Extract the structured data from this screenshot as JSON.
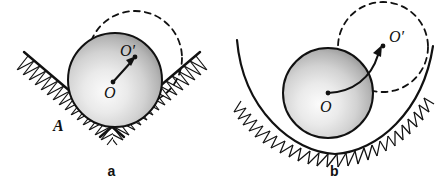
{
  "figure": {
    "background_color": "#ffffff",
    "line_color": "#111111",
    "sphere_fill_light": "#f2f2f2",
    "sphere_fill_dark": "#8f8f8f",
    "panels": [
      {
        "id": "a",
        "caption": "a",
        "support_type": "v-groove",
        "labels": {
          "center_initial": "O",
          "center_final": "O′",
          "contact_point": "A"
        },
        "sphere": {
          "cx": 115,
          "cy": 80,
          "r": 47
        },
        "ghost_circle": {
          "cx": 135,
          "cy": 58,
          "r": 47,
          "style": "dashed"
        },
        "displacement_arrow": {
          "from_label": "O",
          "to_label": "O′",
          "from": [
            113,
            82
          ],
          "to": [
            135,
            58
          ],
          "style": "straight"
        }
      },
      {
        "id": "b",
        "caption": "b",
        "support_type": "concave-trough",
        "labels": {
          "center_initial": "O",
          "center_final": "O′"
        },
        "sphere": {
          "cx": 105,
          "cy": 93,
          "r": 45
        },
        "ghost_circle": {
          "cx": 160,
          "cy": 47,
          "r": 45,
          "style": "dashed"
        },
        "displacement_arrow": {
          "from_label": "O",
          "to_label": "O′",
          "from": [
            105,
            93
          ],
          "to": [
            160,
            47
          ],
          "style": "curved"
        }
      }
    ]
  }
}
